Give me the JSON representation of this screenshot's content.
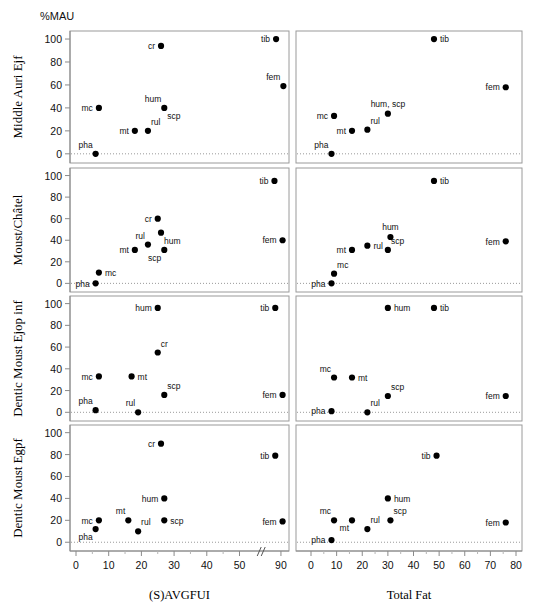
{
  "figure": {
    "corner_label": "%MAU",
    "width": 541,
    "height": 613
  },
  "chart_data": {
    "type": "scatter",
    "title": "%MAU",
    "ylabel": "%MAU",
    "grid": false,
    "legend": "none",
    "layout": "4 rows x 2 columns scatterplot matrix",
    "columns": [
      {
        "key": "savgfui",
        "xlabel": "(S)AVGFUI",
        "xlim": [
          0,
          95
        ],
        "xticks": [
          0,
          10,
          20,
          30,
          40,
          50,
          90
        ],
        "axis_break": true,
        "axis_break_between": [
          50,
          90
        ]
      },
      {
        "key": "totalfat",
        "xlabel": "Total Fat",
        "xlim": [
          -5,
          80
        ],
        "xticks": [
          0,
          10,
          20,
          30,
          40,
          50,
          60,
          70,
          80
        ],
        "axis_break": false
      }
    ],
    "rows": [
      {
        "key": "middle_auri_ejf",
        "ylabel": "Middle Auri Ejf",
        "ylim": [
          -8,
          107
        ],
        "yticks": [
          0,
          20,
          40,
          60,
          80,
          100
        ]
      },
      {
        "key": "moust_chatel",
        "ylabel": "Moust/Châtel",
        "ylim": [
          -8,
          107
        ],
        "yticks": [
          0,
          20,
          40,
          60,
          80,
          100
        ]
      },
      {
        "key": "dentic_moust_ejop_inf",
        "ylabel": "Dentic Moust Ejop inf",
        "ylim": [
          -8,
          107
        ],
        "yticks": [
          0,
          20,
          40,
          60,
          80,
          100
        ]
      },
      {
        "key": "dentic_moust_egpf",
        "ylabel": "Dentic Moust Egpf",
        "ylim": [
          -8,
          107
        ],
        "yticks": [
          0,
          20,
          40,
          60,
          80,
          100
        ]
      }
    ],
    "panels": [
      {
        "row": "middle_auri_ejf",
        "column": "savgfui",
        "points": [
          {
            "label": "pha",
            "x": 6,
            "y": 0,
            "label_pos": "upper-left"
          },
          {
            "label": "mc",
            "x": 7,
            "y": 40,
            "label_pos": "left"
          },
          {
            "label": "mt",
            "x": 18,
            "y": 20,
            "label_pos": "left"
          },
          {
            "label": "rul",
            "x": 22,
            "y": 20,
            "label_pos": "upper-right"
          },
          {
            "label": "hum",
            "x": 27,
            "y": 40,
            "label_pos": "upper-left"
          },
          {
            "label": "scp",
            "x": 27,
            "y": 40,
            "label_pos": "lower-right"
          },
          {
            "label": "cr",
            "x": 26,
            "y": 94,
            "label_pos": "left"
          },
          {
            "label": "tib",
            "x": 84,
            "y": 100,
            "label_pos": "left"
          },
          {
            "label": "fem",
            "x": 93,
            "y": 59,
            "label_pos": "upper-left"
          }
        ]
      },
      {
        "row": "middle_auri_ejf",
        "column": "totalfat",
        "points": [
          {
            "label": "pha",
            "x": 8,
            "y": 0,
            "label_pos": "upper-left"
          },
          {
            "label": "mc",
            "x": 9,
            "y": 33,
            "label_pos": "left"
          },
          {
            "label": "mt",
            "x": 16,
            "y": 20,
            "label_pos": "left"
          },
          {
            "label": "rul",
            "x": 22,
            "y": 21,
            "label_pos": "upper-right"
          },
          {
            "label": "hum, scp",
            "x": 30,
            "y": 35,
            "label_pos": "upper-center"
          },
          {
            "label": "tib",
            "x": 48,
            "y": 100,
            "label_pos": "right"
          },
          {
            "label": "fem",
            "x": 76,
            "y": 58,
            "label_pos": "left"
          }
        ]
      },
      {
        "row": "moust_chatel",
        "column": "savgfui",
        "points": [
          {
            "label": "pha",
            "x": 6,
            "y": 0,
            "label_pos": "left"
          },
          {
            "label": "mc",
            "x": 7,
            "y": 10,
            "label_pos": "right"
          },
          {
            "label": "mt",
            "x": 18,
            "y": 31,
            "label_pos": "left"
          },
          {
            "label": "rul",
            "x": 22,
            "y": 36,
            "label_pos": "upper-left"
          },
          {
            "label": "scp",
            "x": 27,
            "y": 31,
            "label_pos": "lower-left"
          },
          {
            "label": "hum",
            "x": 26,
            "y": 47,
            "label_pos": "lower-right"
          },
          {
            "label": "cr",
            "x": 25,
            "y": 60,
            "label_pos": "left"
          },
          {
            "label": "tib",
            "x": 82,
            "y": 95,
            "label_pos": "left"
          },
          {
            "label": "fem",
            "x": 92,
            "y": 40,
            "label_pos": "left"
          }
        ]
      },
      {
        "row": "moust_chatel",
        "column": "totalfat",
        "points": [
          {
            "label": "pha",
            "x": 8,
            "y": 0,
            "label_pos": "left"
          },
          {
            "label": "mc",
            "x": 9,
            "y": 9,
            "label_pos": "upper-right"
          },
          {
            "label": "mt",
            "x": 16,
            "y": 31,
            "label_pos": "left"
          },
          {
            "label": "rul",
            "x": 22,
            "y": 35,
            "label_pos": "right"
          },
          {
            "label": "scp",
            "x": 30,
            "y": 31,
            "label_pos": "upper-right"
          },
          {
            "label": "hum",
            "x": 31,
            "y": 43,
            "label_pos": "upper-center"
          },
          {
            "label": "tib",
            "x": 48,
            "y": 95,
            "label_pos": "right"
          },
          {
            "label": "fem",
            "x": 76,
            "y": 39,
            "label_pos": "left"
          }
        ]
      },
      {
        "row": "dentic_moust_ejop_inf",
        "column": "savgfui",
        "points": [
          {
            "label": "pha",
            "x": 6,
            "y": 2,
            "label_pos": "upper-left"
          },
          {
            "label": "rul",
            "x": 19,
            "y": 0,
            "label_pos": "upper-left"
          },
          {
            "label": "mc",
            "x": 7,
            "y": 33,
            "label_pos": "left"
          },
          {
            "label": "mt",
            "x": 17,
            "y": 33,
            "label_pos": "right"
          },
          {
            "label": "scp",
            "x": 27,
            "y": 16,
            "label_pos": "upper-right"
          },
          {
            "label": "cr",
            "x": 25,
            "y": 55,
            "label_pos": "upper-right"
          },
          {
            "label": "hum",
            "x": 25,
            "y": 96,
            "label_pos": "left"
          },
          {
            "label": "tib",
            "x": 83,
            "y": 96,
            "label_pos": "left"
          },
          {
            "label": "fem",
            "x": 92,
            "y": 16,
            "label_pos": "left"
          }
        ]
      },
      {
        "row": "dentic_moust_ejop_inf",
        "column": "totalfat",
        "points": [
          {
            "label": "pha",
            "x": 8,
            "y": 1,
            "label_pos": "left"
          },
          {
            "label": "rul",
            "x": 22,
            "y": 0,
            "label_pos": "upper-right"
          },
          {
            "label": "mc",
            "x": 9,
            "y": 32,
            "label_pos": "upper-left"
          },
          {
            "label": "mt",
            "x": 16,
            "y": 32,
            "label_pos": "right"
          },
          {
            "label": "scp",
            "x": 30,
            "y": 15,
            "label_pos": "upper-right"
          },
          {
            "label": "hum",
            "x": 30,
            "y": 96,
            "label_pos": "right"
          },
          {
            "label": "tib",
            "x": 48,
            "y": 96,
            "label_pos": "right"
          },
          {
            "label": "fem",
            "x": 76,
            "y": 15,
            "label_pos": "left"
          }
        ]
      },
      {
        "row": "dentic_moust_egpf",
        "column": "savgfui",
        "points": [
          {
            "label": "pha",
            "x": 6,
            "y": 12,
            "label_pos": "lower-left"
          },
          {
            "label": "mc",
            "x": 7,
            "y": 20,
            "label_pos": "left"
          },
          {
            "label": "mt",
            "x": 16,
            "y": 20,
            "label_pos": "upper-left"
          },
          {
            "label": "rul",
            "x": 19,
            "y": 10,
            "label_pos": "upper-right"
          },
          {
            "label": "scp",
            "x": 27,
            "y": 20,
            "label_pos": "right"
          },
          {
            "label": "hum",
            "x": 27,
            "y": 40,
            "label_pos": "left"
          },
          {
            "label": "cr",
            "x": 26,
            "y": 90,
            "label_pos": "left"
          },
          {
            "label": "tib",
            "x": 83,
            "y": 79,
            "label_pos": "left"
          },
          {
            "label": "fem",
            "x": 92,
            "y": 19,
            "label_pos": "left"
          }
        ]
      },
      {
        "row": "dentic_moust_egpf",
        "column": "totalfat",
        "points": [
          {
            "label": "pha",
            "x": 8,
            "y": 2,
            "label_pos": "left"
          },
          {
            "label": "mc",
            "x": 9,
            "y": 20,
            "label_pos": "upper-left"
          },
          {
            "label": "mt",
            "x": 16,
            "y": 20,
            "label_pos": "lower-left"
          },
          {
            "label": "rul",
            "x": 22,
            "y": 12,
            "label_pos": "upper-right"
          },
          {
            "label": "scp",
            "x": 31,
            "y": 20,
            "label_pos": "upper-right"
          },
          {
            "label": "hum",
            "x": 30,
            "y": 40,
            "label_pos": "right"
          },
          {
            "label": "tib",
            "x": 49,
            "y": 79,
            "label_pos": "left"
          },
          {
            "label": "fem",
            "x": 76,
            "y": 18,
            "label_pos": "left"
          }
        ]
      }
    ]
  }
}
